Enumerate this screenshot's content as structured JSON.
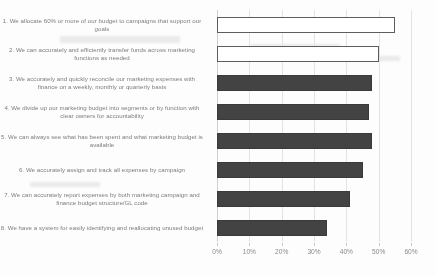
{
  "chart_data": {
    "type": "bar",
    "orientation": "horizontal",
    "title": "",
    "xlabel": "",
    "ylabel": "",
    "xlim": [
      0,
      60
    ],
    "grid": true,
    "legend": null,
    "tick_labels": [
      "0%",
      "10%",
      "20%",
      "30%",
      "40%",
      "50%",
      "60%"
    ],
    "tick_values": [
      0,
      10,
      20,
      30,
      40,
      50,
      60
    ],
    "categories": [
      "1. We allocate 60% or more of our budget to campaigns that support our goals",
      "2. We can accurately and efficiently transfer funds across marketing functions as needed",
      "3. We accurately and quickly reconcile our marketing expenses with finance on a weekly, monthly or quarterly basis",
      "4. We divide up our marketing budget into segments or by function with clear owners for accountability",
      "5. We can always see what has been spent and what marketing budget is available",
      "6. We accurately assign and track all expenses by campaign",
      "7. We can accurately report expenses by both marketing campaign and finance budget structure/GL code",
      "8. We have a system for easily identifying and reallocating unused budget"
    ],
    "values": [
      55,
      50,
      48,
      47,
      48,
      45,
      41,
      34
    ],
    "bar_styles": [
      "hollow",
      "hollow",
      "filled",
      "filled",
      "filled",
      "filled",
      "filled",
      "filled"
    ],
    "colors": {
      "bar_fill": "#434343",
      "bar_hollow_fill": "#ffffff",
      "bar_outline": "#3a3a3a",
      "gridline": "#e3e3e3",
      "label_text": "#7c7c7c",
      "tick_text": "#8a8a8a",
      "background": "#fdfdfd"
    }
  }
}
